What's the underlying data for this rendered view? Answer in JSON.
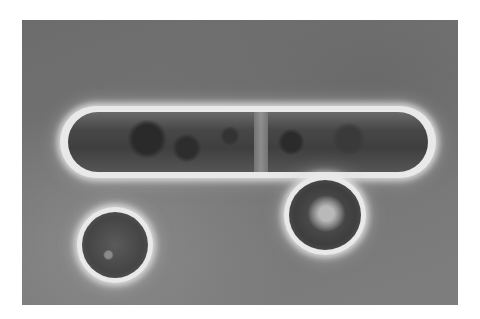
{
  "image": {
    "description": "Phase-contrast micrograph of cells on a gray background: one elongated rod-shaped cell dividing with a central septum, and two smaller oval cells below",
    "colors": {
      "page_background": "#ffffff",
      "field_background": "#757575",
      "halo": "#e9e9e9",
      "cell_interior": "#454545"
    },
    "objects": [
      {
        "name": "dividing rod cell",
        "shape": "elongated ellipse"
      },
      {
        "name": "oval cell right",
        "shape": "oval"
      },
      {
        "name": "round cell left",
        "shape": "round"
      }
    ]
  }
}
